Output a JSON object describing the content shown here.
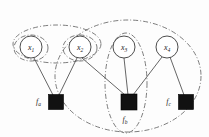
{
  "figure": {
    "kind": "factor-graph-diagram",
    "width": 209,
    "height": 137,
    "background_color": "#fdfdfd"
  },
  "variables": [
    {
      "id": "x1",
      "base": "x",
      "sub": "1",
      "cx": 31,
      "cy": 47,
      "r": 11
    },
    {
      "id": "x2",
      "base": "x",
      "sub": "2",
      "cx": 80,
      "cy": 47,
      "r": 11
    },
    {
      "id": "x3",
      "base": "x",
      "sub": "3",
      "cx": 124,
      "cy": 47,
      "r": 11
    },
    {
      "id": "x4",
      "base": "x",
      "sub": "4",
      "cx": 167,
      "cy": 47,
      "r": 11
    }
  ],
  "factors": [
    {
      "id": "fa",
      "base": "f",
      "sub": "a",
      "cx": 56,
      "cy": 102,
      "size": 15,
      "label_x": 41,
      "label_y": 104,
      "label_anchor": "end"
    },
    {
      "id": "fb",
      "base": "f",
      "sub": "b",
      "cx": 129,
      "cy": 102,
      "size": 16,
      "label_x": 129,
      "label_y": 122,
      "label_anchor": "middle"
    },
    {
      "id": "fc",
      "base": "f",
      "sub": "c",
      "cx": 186,
      "cy": 102,
      "size": 15,
      "label_x": 171,
      "label_y": 104,
      "label_anchor": "end"
    }
  ],
  "edges": [
    {
      "id": "x1-fa",
      "from": "x1",
      "to": "fa"
    },
    {
      "id": "x2-fa",
      "from": "x2",
      "to": "fa"
    },
    {
      "id": "x2-fb",
      "from": "x2",
      "to": "fb"
    },
    {
      "id": "x3-fb",
      "from": "x3",
      "to": "fb"
    },
    {
      "id": "x4-fb",
      "from": "x4",
      "to": "fb"
    },
    {
      "id": "x4-fc",
      "from": "x4",
      "to": "fc"
    }
  ],
  "groups": [
    {
      "id": "group-x1",
      "contains": [
        "x1"
      ],
      "cx": 31,
      "cy": 48,
      "rx": 17,
      "ry": 13,
      "rotate": 0
    },
    {
      "id": "group-x2",
      "contains": [
        "x2"
      ],
      "cx": 80,
      "cy": 48,
      "rx": 17,
      "ry": 13,
      "rotate": 0
    },
    {
      "id": "group-x1-x2",
      "contains": [
        "x1",
        "x2"
      ],
      "cx": 57,
      "cy": 44,
      "rx": 44,
      "ry": 19,
      "rotate": 0
    },
    {
      "id": "group-x3-fb",
      "contains": [
        "x3",
        "fb"
      ],
      "cx": 126,
      "cy": 83,
      "rx": 21,
      "ry": 50,
      "rotate": 0
    },
    {
      "id": "group-outer",
      "contains": [
        "x2",
        "x3",
        "x4",
        "fb",
        "fc"
      ],
      "cx": 128,
      "cy": 76,
      "rx": 73,
      "ry": 56,
      "rotate": 0
    }
  ],
  "colors": {
    "node_stroke": "#3a3a3a",
    "node_fill": "#ffffff",
    "factor_fill": "#111111",
    "edge": "#4a4a4a",
    "group_stroke": "#5c5c5c",
    "text": "#1a1a1a"
  }
}
